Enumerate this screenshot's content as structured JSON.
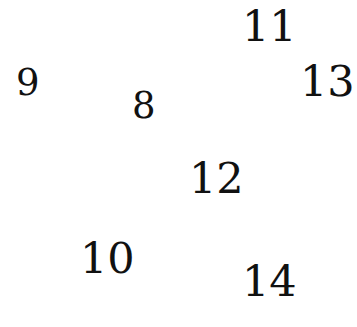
{
  "canvas": {
    "width": 357,
    "height": 327,
    "background_color": "#ffffff",
    "text_color": "#111111"
  },
  "chart_data": {
    "type": "scatter",
    "title": "",
    "subtitle": "",
    "xlabel": "",
    "ylabel": "",
    "legend": [],
    "grid": false,
    "axes_visible": false,
    "tick_labels_x": [],
    "tick_labels_y": [],
    "xlim": [
      0,
      357
    ],
    "ylim": [
      0,
      327
    ],
    "annotations": [
      {
        "label": "11",
        "x": 262,
        "y": 28
      },
      {
        "label": "9",
        "x": 27,
        "y": 84
      },
      {
        "label": "13",
        "x": 320,
        "y": 84
      },
      {
        "label": "8",
        "x": 142,
        "y": 106
      },
      {
        "label": "12",
        "x": 209,
        "y": 181
      },
      {
        "label": "10",
        "x": 100,
        "y": 261
      },
      {
        "label": "14",
        "x": 263,
        "y": 284
      }
    ],
    "values": [
      11,
      9,
      13,
      8,
      12,
      10,
      14
    ],
    "point_count": 7
  },
  "labels": [
    {
      "text": "11",
      "name": "number-label-11",
      "left": 242,
      "top": 5,
      "font_size": 43
    },
    {
      "text": "9",
      "name": "number-label-9",
      "left": 16,
      "top": 64,
      "font_size": 37
    },
    {
      "text": "13",
      "name": "number-label-13",
      "left": 300,
      "top": 60,
      "font_size": 43
    },
    {
      "text": "8",
      "name": "number-label-8",
      "left": 132,
      "top": 87,
      "font_size": 37
    },
    {
      "text": "12",
      "name": "number-label-12",
      "left": 189,
      "top": 157,
      "font_size": 43
    },
    {
      "text": "10",
      "name": "number-label-10",
      "left": 80,
      "top": 237,
      "font_size": 43
    },
    {
      "text": "14",
      "name": "number-label-14",
      "left": 242,
      "top": 260,
      "font_size": 43
    }
  ]
}
